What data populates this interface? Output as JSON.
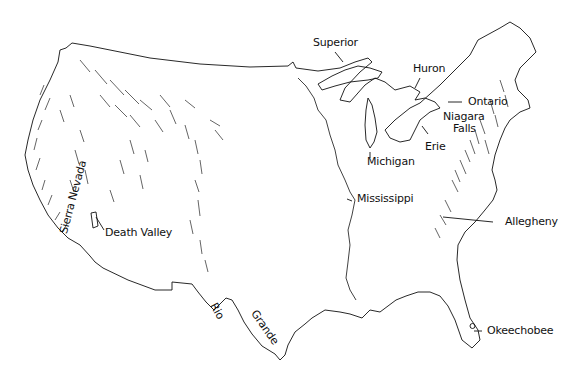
{
  "map": {
    "subject": "United States outline with physical features",
    "colors": {
      "ink": "#111111",
      "background": "#ffffff"
    },
    "labels": {
      "superior": "Superior",
      "huron": "Huron",
      "ontario": "Ontario",
      "niagara_1": "Niagara",
      "niagara_2": "Falls",
      "erie": "Erie",
      "michigan": "Michigan",
      "mississippi": "Mississippi",
      "allegheny": "Allegheny",
      "okeechobee": "Okeechobee",
      "death_valley": "Death Valley",
      "sierra_nevada": "Sierra Nevada",
      "rio": "Rio",
      "grande": "Grande"
    }
  }
}
